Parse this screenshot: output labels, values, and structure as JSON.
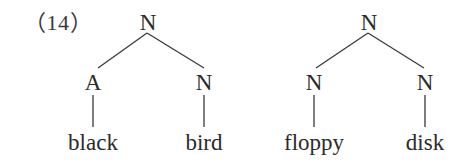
{
  "example_number": "（14）",
  "trees": [
    {
      "id": "black-bird",
      "root": {
        "label": "N",
        "x": 148,
        "y": 22
      },
      "children": [
        {
          "label": "A",
          "x": 93,
          "y": 82,
          "word": "black",
          "word_x": 93,
          "word_y": 142
        },
        {
          "label": "N",
          "x": 204,
          "y": 82,
          "word": "bird",
          "word_x": 204,
          "word_y": 142
        }
      ]
    },
    {
      "id": "floppy-disk",
      "root": {
        "label": "N",
        "x": 369,
        "y": 22
      },
      "children": [
        {
          "label": "N",
          "x": 314,
          "y": 82,
          "word": "floppy",
          "word_x": 314,
          "word_y": 142
        },
        {
          "label": "N",
          "x": 425,
          "y": 82,
          "word": "disk",
          "word_x": 425,
          "word_y": 142
        }
      ]
    }
  ],
  "lines": {
    "tree1": {
      "root_to_left": {
        "x1": 147,
        "y1": 33,
        "x2": 98,
        "y2": 68
      },
      "root_to_right": {
        "x1": 147,
        "y1": 33,
        "x2": 204,
        "y2": 68
      },
      "left_stem": {
        "x1": 93,
        "y1": 95,
        "x2": 93,
        "y2": 127
      },
      "right_stem": {
        "x1": 204,
        "y1": 95,
        "x2": 204,
        "y2": 127
      }
    },
    "tree2": {
      "root_to_left": {
        "x1": 368,
        "y1": 33,
        "x2": 316,
        "y2": 68
      },
      "root_to_right": {
        "x1": 368,
        "y1": 33,
        "x2": 424,
        "y2": 68
      },
      "left_stem": {
        "x1": 314,
        "y1": 95,
        "x2": 314,
        "y2": 127
      },
      "right_stem": {
        "x1": 425,
        "y1": 95,
        "x2": 425,
        "y2": 127
      }
    }
  }
}
